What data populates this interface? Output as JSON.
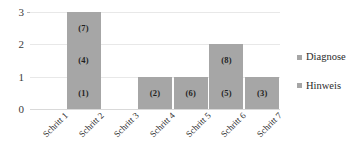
{
  "chart_data": {
    "type": "bar",
    "stacked": true,
    "title": "",
    "xlabel": "",
    "ylabel": "",
    "ylim": [
      0,
      3
    ],
    "yticks": [
      0,
      1,
      2,
      3
    ],
    "grid": true,
    "legend_position": "right",
    "bar_color": "#a6a6a6",
    "categories": [
      "Schritt 1",
      "Schritt 2",
      "Schritt 3",
      "Schritt 4",
      "Schritt 5",
      "Schritt 6",
      "Schritt 7"
    ],
    "values": [
      0,
      3,
      0,
      1,
      1,
      2,
      1
    ],
    "legend": [
      "Diagnose",
      "Hinweis"
    ],
    "series": [
      {
        "name": "Diagnose",
        "values": [
          0,
          3,
          0,
          1,
          1,
          2,
          1
        ]
      }
    ],
    "segments": [
      {
        "category": "Schritt 1",
        "labels": []
      },
      {
        "category": "Schritt 2",
        "labels": [
          "(1)",
          "(4)",
          "(7)"
        ]
      },
      {
        "category": "Schritt 3",
        "labels": []
      },
      {
        "category": "Schritt 4",
        "labels": [
          "(2)"
        ]
      },
      {
        "category": "Schritt 5",
        "labels": [
          "(6)"
        ]
      },
      {
        "category": "Schritt 6",
        "labels": [
          "(5)",
          "(8)"
        ]
      },
      {
        "category": "Schritt 7",
        "labels": [
          "(3)"
        ]
      }
    ]
  }
}
